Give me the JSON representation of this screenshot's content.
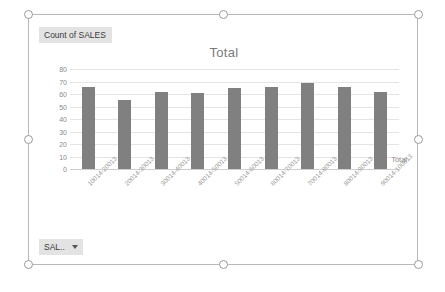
{
  "chart_object": {
    "legend_field_button": "Count of SALES",
    "axis_field_button": "SAL..",
    "axis_field_caret": "chevron-down-icon"
  },
  "chart_data": {
    "type": "bar",
    "title": "Total",
    "xlabel": "",
    "ylabel": "",
    "ylim": [
      0,
      80
    ],
    "yticks": [
      "0",
      "10",
      "20",
      "30",
      "40",
      "50",
      "60",
      "70",
      "80"
    ],
    "grid": true,
    "legend_position": "right",
    "legend": [
      "Total"
    ],
    "series": [
      {
        "name": "Total",
        "color": "#808080",
        "values": [
          66,
          55,
          62,
          61,
          65,
          66,
          69,
          66,
          62
        ]
      }
    ],
    "categories": [
      "10014-20013",
      "20014-30013",
      "30014-40013",
      "40014-50013",
      "50014-60013",
      "60014-70013",
      "70014-80013",
      "80014-90013",
      "90014-100013"
    ]
  }
}
